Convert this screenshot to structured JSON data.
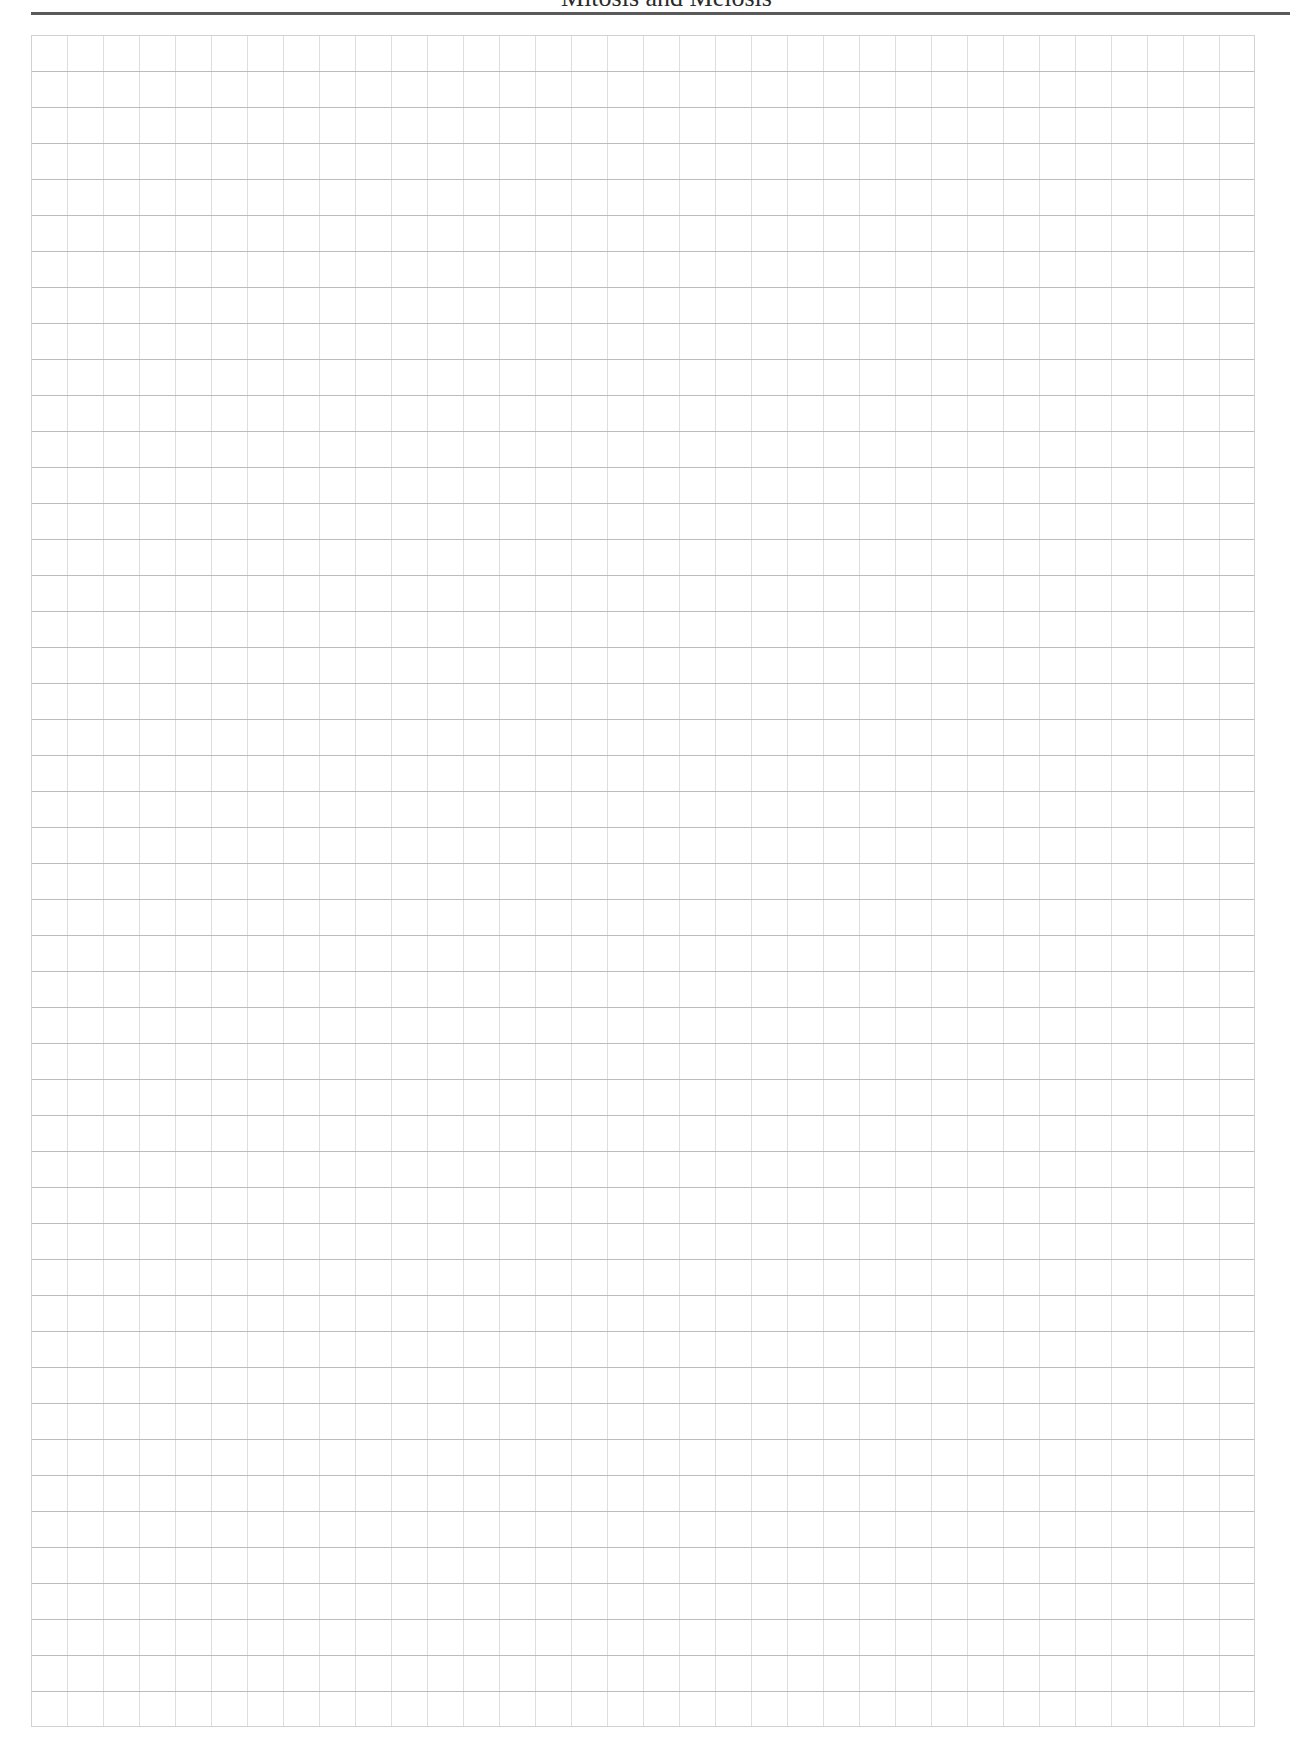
{
  "page": {
    "running_head": "Mitosis and Meiosis",
    "grid": {
      "columns": 34,
      "rows": 47,
      "cell_size_px": 36,
      "horizontal_line_color": "#bcbcbc",
      "vertical_line_color": "#dedede",
      "border_color": "#d2d2d2"
    },
    "header_rule_color": "#5a5a5a"
  }
}
